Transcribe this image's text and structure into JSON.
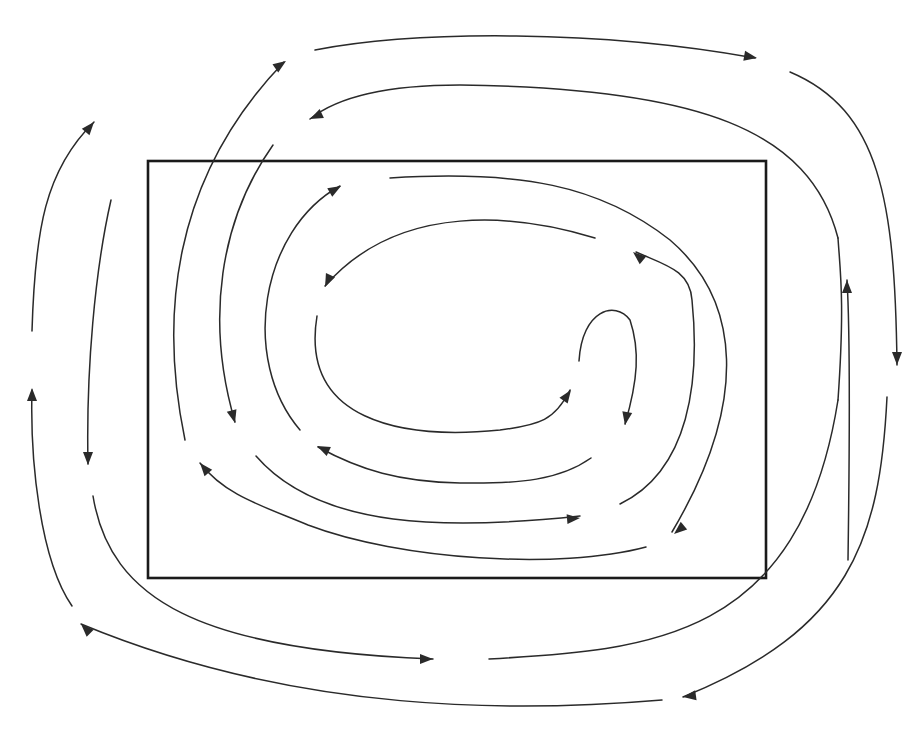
{
  "diagram": {
    "title": "",
    "colors": {
      "background": "#ffffff",
      "stroke": "#2a2a2a",
      "frame": "#1a1a1a"
    },
    "frame": {
      "x": 148,
      "y": 161,
      "width": 618,
      "height": 417
    },
    "streamlines": [
      {
        "id": "outer-top",
        "d": "M 315 50 C 420 30, 600 30, 755 58",
        "arrow": "end"
      },
      {
        "id": "outer-right",
        "d": "M 790 72 C 880 110, 895 200, 897 365",
        "arrow": "end"
      },
      {
        "id": "outer-right-inner-up",
        "d": "M 848 560 C 850 420, 850 330, 847 280",
        "arrow": "end"
      },
      {
        "id": "outer-bottom-right",
        "d": "M 887 397 C 880 540, 850 630, 683 697",
        "arrow": "end"
      },
      {
        "id": "outer-bottom",
        "d": "M 662 700 C 520 712, 300 715, 81 624",
        "arrow": "end"
      },
      {
        "id": "outer-left-up",
        "d": "M 72 606 C 40 560, 30 460, 32 390",
        "arrow": "end"
      },
      {
        "id": "outer-left-top",
        "d": "M 32 331 C 35 230, 45 170, 94 122",
        "arrow": "end"
      },
      {
        "id": "second-left-down",
        "d": "M 111 200 C 95 270, 86 370, 88 464",
        "arrow": "end"
      },
      {
        "id": "second-bottom",
        "d": "M 93 496 C 110 600, 200 650, 433 659",
        "arrow": "end"
      },
      {
        "id": "second-bottom-right",
        "d": "M 489 659 C 650 650, 800 640, 838 400",
        "arrow": "none"
      },
      {
        "id": "second-right-up",
        "d": "M 838 400 C 845 300, 840 270, 838 238",
        "arrow": "none"
      },
      {
        "id": "second-top",
        "d": "M 838 238 C 810 130, 700 88, 460 85 C 390 85, 340 95, 310 119",
        "arrow": "end"
      },
      {
        "id": "third-left-up",
        "d": "M 185 440 C 160 320, 170 180, 284 62",
        "arrow": "end"
      },
      {
        "id": "fourth-left-down",
        "d": "M 273 145 C 220 220, 205 320, 235 422",
        "arrow": "end"
      },
      {
        "id": "fourth-bottom",
        "d": "M 256 456 C 320 530, 450 530, 580 516",
        "arrow": "end"
      },
      {
        "id": "fourth-right",
        "d": "M 620 504 C 690 470, 700 380, 692 300 C 690 270, 665 265, 636 252",
        "arrow": "end"
      },
      {
        "id": "fifth-left-up",
        "d": "M 300 430 C 240 360, 260 230, 340 186",
        "arrow": "end"
      },
      {
        "id": "fifth-top",
        "d": "M 390 178 C 520 170, 600 185, 670 240 C 740 300, 750 400, 672 532",
        "arrow": "end"
      },
      {
        "id": "fifth-bottom",
        "d": "M 646 547 C 560 570, 400 560, 308 525 C 260 505, 225 495, 200 463",
        "arrow": "end"
      },
      {
        "id": "inner-top",
        "d": "M 595 238 C 520 215, 400 200, 325 286",
        "arrow": "end"
      },
      {
        "id": "inner-bottom",
        "d": "M 317 316 C 300 420, 400 440, 500 430 C 540 425, 555 420, 570 390",
        "arrow": "end"
      },
      {
        "id": "inner-hook",
        "d": "M 579 361 C 582 310, 615 300, 630 320 C 640 350, 638 380, 625 424",
        "arrow": "end"
      },
      {
        "id": "inner-return",
        "d": "M 591 458 C 560 480, 520 484, 460 483 C 400 482, 360 470, 318 447",
        "arrow": "end"
      }
    ],
    "arrowheads": [
      {
        "id": "ah-outer-top",
        "x": 757,
        "y": 58,
        "angle": 10
      },
      {
        "id": "ah-outer-right",
        "x": 897,
        "y": 365,
        "angle": 90
      },
      {
        "id": "ah-outer-right-inner-up",
        "x": 847,
        "y": 280,
        "angle": -90
      },
      {
        "id": "ah-outer-bottom-right",
        "x": 683,
        "y": 697,
        "angle": 172
      },
      {
        "id": "ah-outer-bottom",
        "x": 81,
        "y": 624,
        "angle": 225
      },
      {
        "id": "ah-outer-left-up",
        "x": 32,
        "y": 388,
        "angle": -90
      },
      {
        "id": "ah-outer-left-top",
        "x": 94,
        "y": 122,
        "angle": -50
      },
      {
        "id": "ah-second-left-down",
        "x": 88,
        "y": 465,
        "angle": 90
      },
      {
        "id": "ah-second-bottom",
        "x": 433,
        "y": 659,
        "angle": 0
      },
      {
        "id": "ah-second-top",
        "x": 310,
        "y": 119,
        "angle": 155
      },
      {
        "id": "ah-third-left-up",
        "x": 286,
        "y": 61,
        "angle": -35
      },
      {
        "id": "ah-fourth-left-down",
        "x": 235,
        "y": 423,
        "angle": 75
      },
      {
        "id": "ah-fourth-bottom",
        "x": 580,
        "y": 518,
        "angle": -5
      },
      {
        "id": "ah-fourth-right",
        "x": 633,
        "y": 252,
        "angle": 220
      },
      {
        "id": "ah-fifth-left-up",
        "x": 341,
        "y": 186,
        "angle": -30
      },
      {
        "id": "ah-fifth-top",
        "x": 674,
        "y": 534,
        "angle": 140
      },
      {
        "id": "ah-fifth-bottom",
        "x": 200,
        "y": 463,
        "angle": 230
      },
      {
        "id": "ah-inner-top",
        "x": 325,
        "y": 287,
        "angle": 115
      },
      {
        "id": "ah-inner-bottom",
        "x": 571,
        "y": 390,
        "angle": -55
      },
      {
        "id": "ah-inner-hook",
        "x": 625,
        "y": 425,
        "angle": 100
      },
      {
        "id": "ah-inner-return",
        "x": 317,
        "y": 446,
        "angle": 205
      }
    ]
  }
}
